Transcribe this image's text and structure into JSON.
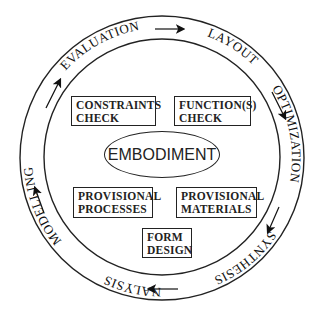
{
  "diagram": {
    "center": "EMBODIMENT",
    "cycle_stages": [
      "EVALUATION",
      "MODELLING",
      "ANALYSIS",
      "SYNTHESIS",
      "OPTIMIZATION",
      "LAYOUT"
    ],
    "boxes": {
      "constraints": [
        "CONSTRAINTS",
        "CHECK"
      ],
      "functions": [
        "FUNCTION(S)",
        "CHECK"
      ],
      "processes": [
        "PROVISIONAL",
        "PROCESSES"
      ],
      "materials": [
        "PROVISIONAL",
        "MATERIALS"
      ],
      "form": [
        "FORM",
        "DESIGN"
      ]
    },
    "colors": {
      "line": "#222222",
      "background": "#ffffff"
    }
  }
}
